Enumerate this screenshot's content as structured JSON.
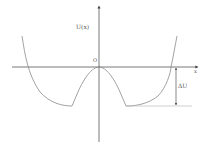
{
  "diagram": {
    "type": "potential-energy-curve",
    "labels": {
      "y_axis": "U(x)",
      "x_axis": "x",
      "origin": "O",
      "delta": "ΔU"
    },
    "colors": {
      "axis": "#444444",
      "curve": "#8a8a8a",
      "text": "#555555",
      "baseline": "#bbbbbb"
    }
  }
}
